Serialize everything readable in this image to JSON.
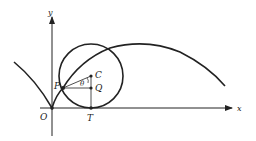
{
  "diagram": {
    "type": "cycloid-construction",
    "axes": {
      "x_label": "x",
      "y_label": "y"
    },
    "points": {
      "origin": "O",
      "point_on_curve": "P",
      "center": "C",
      "foot_on_radius": "Q",
      "tangent_point": "T"
    },
    "angle_label": "θ",
    "colors": {
      "stroke": "#222222",
      "background": "#ffffff"
    }
  }
}
